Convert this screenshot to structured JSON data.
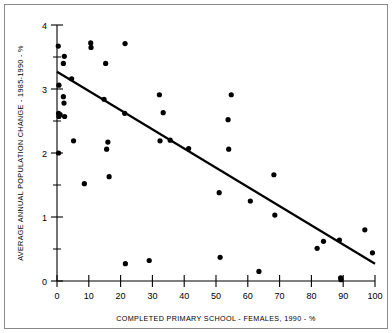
{
  "figure": {
    "frame_border_color": "#8a8a8a",
    "background_color": "#ffffff",
    "ink_color": "#000000"
  },
  "chart_data": {
    "type": "scatter",
    "title": "",
    "subtitle": "",
    "xlabel": "COMPLETED PRIMARY SCHOOL - FEMALES, 1990 - %",
    "ylabel": "AVERAGE ANNUAL POPULATION CHANGE - 1985-1990 - %",
    "xlim": [
      0,
      100
    ],
    "ylim": [
      0,
      4
    ],
    "xticks": [
      0,
      10,
      20,
      30,
      40,
      50,
      60,
      70,
      80,
      90,
      100
    ],
    "xticklabels": [
      "0",
      "10",
      "20",
      "30",
      "40",
      "50",
      "60",
      "70",
      "80",
      "90",
      "100"
    ],
    "yticks": [
      0,
      1,
      2,
      3,
      4
    ],
    "yticklabels": [
      "0",
      "1",
      "2",
      "3",
      "4"
    ],
    "yminorticks": [
      0.5,
      1.5,
      2.5,
      3.5
    ],
    "grid": false,
    "legend": null,
    "marker": "filled-circle",
    "marker_color": "#000000",
    "points": [
      [
        0.4,
        3.67
      ],
      [
        0.6,
        3.06
      ],
      [
        0.5,
        2.62
      ],
      [
        0.6,
        2.57
      ],
      [
        0.5,
        2.0
      ],
      [
        1.0,
        2.6
      ],
      [
        2.0,
        3.4
      ],
      [
        2.3,
        3.51
      ],
      [
        2.0,
        2.88
      ],
      [
        2.2,
        2.78
      ],
      [
        2.4,
        2.57
      ],
      [
        4.6,
        3.16
      ],
      [
        5.2,
        2.19
      ],
      [
        8.6,
        1.52
      ],
      [
        10.6,
        3.72
      ],
      [
        10.7,
        3.65
      ],
      [
        14.8,
        2.84
      ],
      [
        15.6,
        2.06
      ],
      [
        16.0,
        2.17
      ],
      [
        15.3,
        3.4
      ],
      [
        16.4,
        1.63
      ],
      [
        21.4,
        3.71
      ],
      [
        21.3,
        2.62
      ],
      [
        21.5,
        0.27
      ],
      [
        29.0,
        0.32
      ],
      [
        32.2,
        2.91
      ],
      [
        32.4,
        2.19
      ],
      [
        33.4,
        2.63
      ],
      [
        35.6,
        2.2
      ],
      [
        41.4,
        2.07
      ],
      [
        51.0,
        1.38
      ],
      [
        51.3,
        0.37
      ],
      [
        53.8,
        2.52
      ],
      [
        54.0,
        2.06
      ],
      [
        54.8,
        2.91
      ],
      [
        60.8,
        1.25
      ],
      [
        63.5,
        0.15
      ],
      [
        68.2,
        1.66
      ],
      [
        68.5,
        1.03
      ],
      [
        81.8,
        0.51
      ],
      [
        83.8,
        0.62
      ],
      [
        88.8,
        0.64
      ],
      [
        89.2,
        0.05
      ],
      [
        89.3,
        0.02
      ],
      [
        96.8,
        0.8
      ],
      [
        99.2,
        0.44
      ]
    ],
    "trendline": {
      "type": "line",
      "x": [
        0,
        100
      ],
      "y": [
        3.27,
        0.27
      ],
      "slope": -0.03,
      "intercept": 3.27
    }
  }
}
